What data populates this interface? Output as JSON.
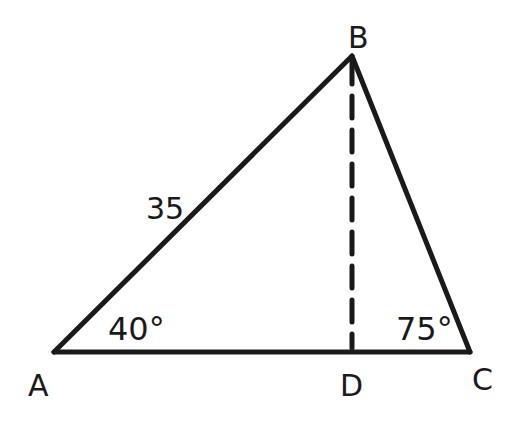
{
  "diagram": {
    "type": "triangle",
    "stroke_color": "#1a1a1a",
    "background": "#ffffff",
    "vertices": {
      "A": {
        "label": "A",
        "x": 54,
        "y": 352
      },
      "B": {
        "label": "B",
        "x": 352,
        "y": 56
      },
      "C": {
        "label": "C",
        "x": 470,
        "y": 352
      },
      "D": {
        "label": "D",
        "x": 352,
        "y": 352
      }
    },
    "side_labels": {
      "AB": "35"
    },
    "angle_labels": {
      "A": "40°",
      "C": "75°"
    },
    "altitude": {
      "from": "B",
      "to": "D",
      "style": "dashed"
    }
  }
}
